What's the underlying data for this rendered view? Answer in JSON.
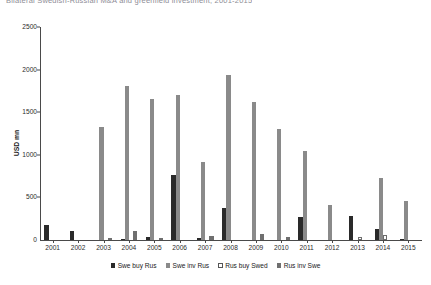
{
  "title": "Bilateral Swedish-Russian M&A and greenfield investment, 2001-2015",
  "chart_data": {
    "type": "bar",
    "title": "Bilateral Swedish-Russian M&A and greenfield investment, 2001-2015",
    "xlabel": "",
    "ylabel": "USD mn",
    "ylim": [
      0,
      2500
    ],
    "yticks": [
      0,
      500,
      1000,
      1500,
      2000,
      2500
    ],
    "ytick_labels": [
      "0",
      "500",
      "1000",
      "1500",
      "2000",
      "2500"
    ],
    "grid": false,
    "legend_position": "bottom",
    "categories": [
      "2001",
      "2002",
      "2003",
      "2004",
      "2005",
      "2006",
      "2007",
      "2008",
      "2009",
      "2010",
      "2011",
      "2012",
      "2013",
      "2014",
      "2015"
    ],
    "series": [
      {
        "name": "Swe buy Rus",
        "color": "#2a2a2a",
        "values": [
          175,
          110,
          0,
          10,
          35,
          765,
          20,
          375,
          0,
          0,
          265,
          0,
          285,
          125,
          15
        ]
      },
      {
        "name": "Swe inv Rus",
        "color": "#8a8a8a",
        "values": [
          0,
          0,
          1330,
          1810,
          1660,
          1705,
          910,
          1940,
          1620,
          1300,
          1040,
          410,
          0,
          730,
          455
        ]
      },
      {
        "name": "Rus buy Swed",
        "color": "#ffffff",
        "values": [
          0,
          0,
          0,
          0,
          0,
          0,
          0,
          0,
          0,
          0,
          0,
          0,
          30,
          60,
          0
        ]
      },
      {
        "name": "Rus inv Swe",
        "color": "#6f6f6f",
        "values": [
          0,
          0,
          25,
          110,
          20,
          0,
          45,
          0,
          75,
          35,
          0,
          0,
          0,
          0,
          0
        ]
      }
    ]
  },
  "legend": {
    "items": [
      {
        "label": "Swe buy Rus"
      },
      {
        "label": "Swe inv Rus"
      },
      {
        "label": "Rus buy Swed"
      },
      {
        "label": "Rus inv Swe"
      }
    ]
  }
}
